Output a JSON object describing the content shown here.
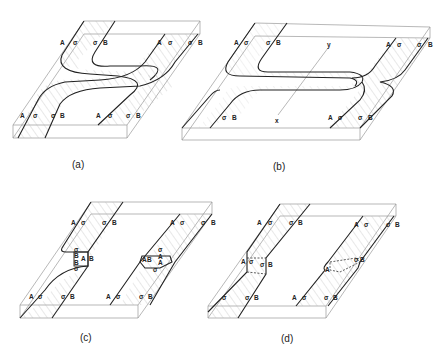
{
  "figure": {
    "panels": [
      {
        "id": "a",
        "caption": "(a)",
        "labels_top_left": [
          "A",
          "σ",
          "σ",
          "B"
        ],
        "labels_top_right": [
          "A",
          "σ",
          "σ",
          "B"
        ],
        "labels_bottom_left": [
          "A",
          "σ",
          "σ",
          "B"
        ],
        "labels_bottom_right": [
          "A",
          "σ",
          "σ",
          "B"
        ],
        "description": "Two hatched bands crossing in an S-shaped overlap across the slab"
      },
      {
        "id": "b",
        "caption": "(b)",
        "labels_top_left": [
          "A",
          "σ",
          "σ",
          "B"
        ],
        "labels_top_right": [
          "A",
          "σ",
          "σ",
          "B"
        ],
        "labels_bottom_left": [
          "σ",
          "B"
        ],
        "labels_bottom_right": [
          "A",
          "σ",
          "σ",
          "B"
        ],
        "axis_labels": [
          "y",
          "x"
        ],
        "description": "Bands stretched into long horizontal hairpin loops with x-y axis line"
      },
      {
        "id": "c",
        "caption": "(c)",
        "labels_top_left": [
          "A",
          "σ",
          "σ",
          "B"
        ],
        "labels_top_right": [
          "A",
          "σ",
          "σ",
          "B"
        ],
        "labels_bottom_left": [
          "A",
          "σ",
          "σ",
          "B"
        ],
        "labels_bottom_right": [
          "A",
          "σ",
          "σ",
          "B"
        ],
        "junction_left": [
          "σ",
          "B",
          "A",
          "B",
          "B",
          "σ"
        ],
        "junction_right": [
          "σ",
          "A",
          "A",
          "B",
          "A",
          "σ"
        ],
        "description": "Two separate bands with small box-shaped junction defects"
      },
      {
        "id": "d",
        "caption": "(d)",
        "labels_top_left": [
          "A",
          "σ",
          "σ",
          "B"
        ],
        "labels_top_right": [
          "A",
          "σ",
          "σ",
          "B"
        ],
        "labels_bottom_left": [
          "σ",
          "σ",
          "B"
        ],
        "labels_bottom_right": [
          "A",
          "σ",
          "σ",
          "B"
        ],
        "junction_left": [
          "A",
          "σ",
          "σ",
          "B"
        ],
        "junction_right": [
          "A",
          "σ",
          "B"
        ],
        "description": "Two separate bands with dashed-outline junction defects"
      }
    ]
  }
}
